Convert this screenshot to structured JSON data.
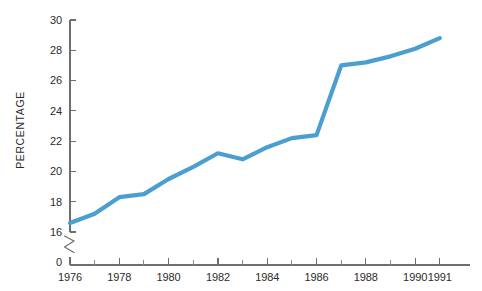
{
  "chart_data": {
    "type": "line",
    "title": "",
    "subtitle": "",
    "xlabel": "",
    "ylabel": "PERCENTAGE",
    "x": [
      1976,
      1977,
      1978,
      1979,
      1980,
      1981,
      1982,
      1983,
      1984,
      1985,
      1986,
      1987,
      1988,
      1989,
      1990,
      1991
    ],
    "values": [
      16.6,
      17.2,
      18.3,
      18.5,
      19.5,
      20.3,
      21.2,
      20.8,
      21.6,
      22.2,
      22.4,
      27.0,
      27.2,
      27.6,
      28.1,
      28.8
    ],
    "series": [
      {
        "name": "percentage",
        "color": "#4a9fd0",
        "values": [
          16.6,
          17.2,
          18.3,
          18.5,
          19.5,
          20.3,
          21.2,
          20.8,
          21.6,
          22.2,
          22.4,
          27.0,
          27.2,
          27.6,
          28.1,
          28.8
        ]
      }
    ],
    "xlim": [
      1976,
      1991.9
    ],
    "ylim": [
      16,
      30
    ],
    "y_axis_break": true,
    "y_break_from": 0,
    "y_break_to": 16,
    "y_tick_labels": [
      "30",
      "28",
      "26",
      "24",
      "22",
      "20",
      "18",
      "16",
      "0"
    ],
    "y_tick_values": [
      30,
      28,
      26,
      24,
      22,
      20,
      18,
      16
    ],
    "y_zero_label": "0",
    "x_tick_labels": [
      "1976",
      "1978",
      "1980",
      "1982",
      "1984",
      "1986",
      "1988",
      "1990",
      "1991"
    ],
    "x_tick_values": [
      1976,
      1978,
      1980,
      1982,
      1984,
      1986,
      1988,
      1990,
      1991
    ],
    "x_minor_tick_values": [
      1977,
      1979,
      1981,
      1983,
      1985,
      1987,
      1989
    ],
    "grid": false,
    "legend": "none",
    "annotations": []
  },
  "colors": {
    "line": "#4a9fd0",
    "axis": "#6e6e6e",
    "text": "#2b2b2b",
    "background": "#ffffff"
  }
}
